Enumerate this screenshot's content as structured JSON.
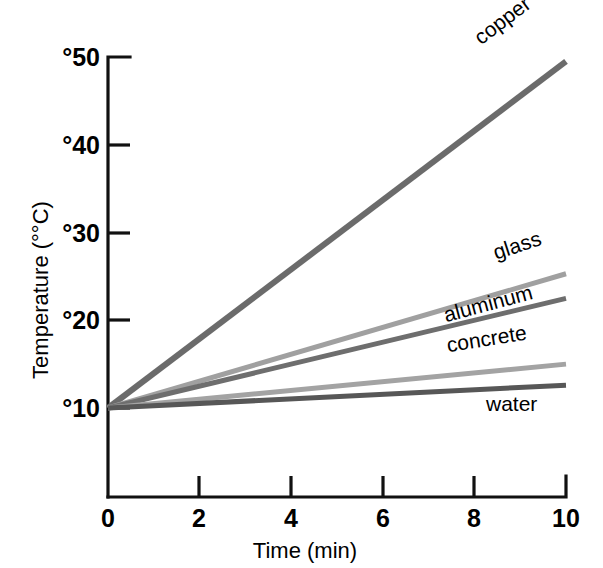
{
  "chart_data": {
    "type": "line",
    "title": "",
    "xlabel": "Time (min)",
    "ylabel": "Temperature (°°C)",
    "xlim": [
      0,
      10
    ],
    "ylim": [
      0,
      50
    ],
    "grid": false,
    "legend_position": "inline-right-of-line",
    "x_ticks": [
      {
        "value": 0,
        "label": "0"
      },
      {
        "value": 2,
        "label": "2"
      },
      {
        "value": 4,
        "label": "4"
      },
      {
        "value": 6,
        "label": "6"
      },
      {
        "value": 8,
        "label": "8"
      },
      {
        "value": 10,
        "label": "10"
      }
    ],
    "y_ticks": [
      {
        "value": 10,
        "label": "°10"
      },
      {
        "value": 20,
        "label": "°20"
      },
      {
        "value": 30,
        "label": "°30"
      },
      {
        "value": 40,
        "label": "°40"
      },
      {
        "value": 50,
        "label": "°50"
      }
    ],
    "x": [
      0,
      10
    ],
    "series": [
      {
        "name": "copper",
        "label": "copper",
        "color": "#6b6b6b",
        "width": 6,
        "values": [
          10,
          49.5
        ]
      },
      {
        "name": "glass",
        "label": "glass",
        "color": "#a0a0a0",
        "width": 5,
        "values": [
          10,
          25.3
        ]
      },
      {
        "name": "aluminum",
        "label": "aluminum",
        "color": "#6e6e6e",
        "width": 5,
        "values": [
          10,
          22.5
        ]
      },
      {
        "name": "concrete",
        "label": "concrete",
        "color": "#a3a3a3",
        "width": 5,
        "values": [
          10,
          15.0
        ]
      },
      {
        "name": "water",
        "label": "water",
        "color": "#575757",
        "width": 5,
        "values": [
          10,
          12.6
        ]
      }
    ]
  },
  "labels": {
    "copper": "copper",
    "glass": "glass",
    "aluminum": "aluminum",
    "concrete": "concrete",
    "water": "water",
    "y_50": "°50",
    "y_40": "°40",
    "y_30": "°30",
    "y_20": "°20",
    "y_10": "°10",
    "x_0": "0",
    "x_2": "2",
    "x_4": "4",
    "x_6": "6",
    "x_8": "8",
    "x_10": "10",
    "x_axis_title": "Time (min)",
    "y_axis_title": "Temperature (°°C)"
  }
}
